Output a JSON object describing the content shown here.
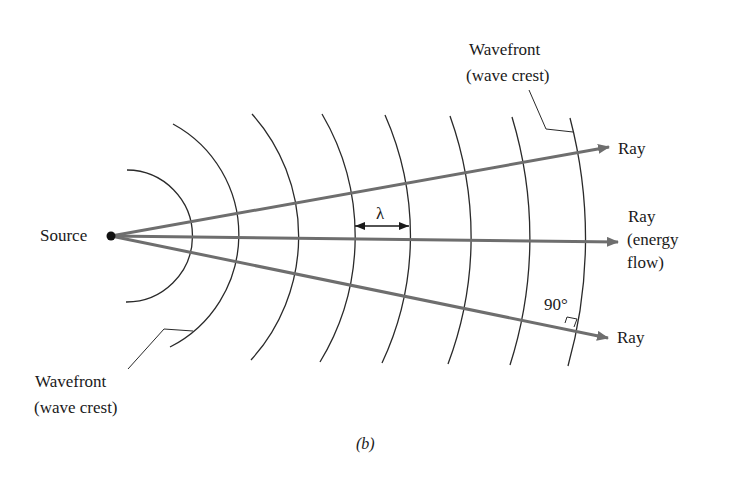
{
  "figure": {
    "caption": "(b)",
    "source_label": "Source",
    "wavelength_label": "λ",
    "angle_label": "90°",
    "wavefront_top": {
      "line1": "Wavefront",
      "line2": "(wave crest)"
    },
    "wavefront_bottom": {
      "line1": "Wavefront",
      "line2": "(wave crest)"
    },
    "rays": [
      {
        "id": "upper",
        "label": "Ray"
      },
      {
        "id": "middle",
        "line1": "Ray",
        "line2": "(energy",
        "line3": "flow)"
      },
      {
        "id": "lower",
        "label": "Ray"
      }
    ],
    "colors": {
      "ray": "#6e6e6e",
      "wavefront": "#2a2a2a",
      "text": "#1a1a1a"
    },
    "wavefront_count": 8
  }
}
